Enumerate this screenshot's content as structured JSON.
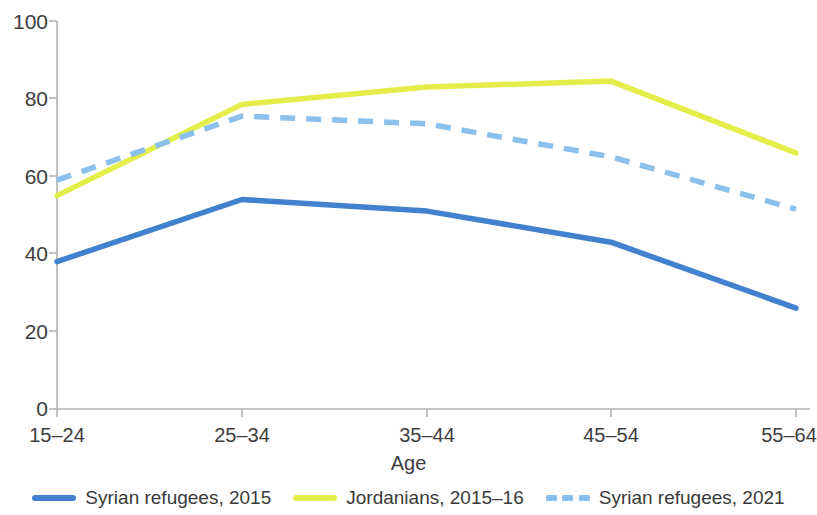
{
  "chart_data": {
    "type": "line",
    "title": "",
    "subtitle": "",
    "xlabel": "Age",
    "ylabel": "",
    "categories": [
      "15–24",
      "25–34",
      "35–44",
      "45–54",
      "55–64"
    ],
    "ylim": [
      0,
      100
    ],
    "y_ticks": [
      0,
      20,
      40,
      60,
      80,
      100
    ],
    "grid": false,
    "legend_position": "bottom",
    "series": [
      {
        "name": "Syrian refugees, 2015",
        "color": "#4281ce",
        "style": "solid",
        "values": [
          38,
          54,
          51,
          43,
          26
        ]
      },
      {
        "name": "Jordanians, 2015–16",
        "color": "#e4ee4b",
        "style": "solid",
        "values": [
          55,
          78.5,
          83,
          84.5,
          66
        ]
      },
      {
        "name": "Syrian refugees, 2021",
        "color": "#8cc0ec",
        "style": "dashed",
        "values": [
          59,
          75.5,
          73.5,
          65,
          51.5
        ]
      }
    ]
  },
  "axes": {
    "y_tick_labels": [
      "100",
      "80",
      "60",
      "40",
      "20",
      "0"
    ],
    "x_tick_labels": [
      "15–24",
      "25–34",
      "35–44",
      "45–54",
      "55–64"
    ],
    "x_title": "Age"
  },
  "legend": {
    "items": [
      {
        "label": "Syrian refugees, 2015",
        "color": "#4281ce",
        "style": "solid"
      },
      {
        "label": "Jordanians, 2015–16",
        "color": "#e4ee4b",
        "style": "solid"
      },
      {
        "label": "Syrian refugees, 2021",
        "color": "#8cc0ec",
        "style": "dashed"
      }
    ]
  },
  "colors": {
    "axis": "#b0b0b0",
    "text": "#3a3a3a",
    "series_1": "#4281ce",
    "series_2": "#e4ee4b",
    "series_3": "#8cc0ec"
  }
}
